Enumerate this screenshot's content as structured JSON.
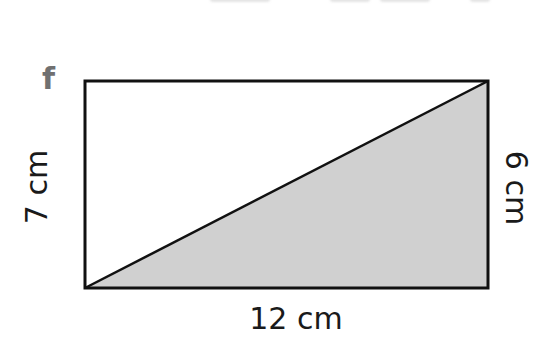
{
  "figure": {
    "part_label": "f",
    "shape": "rectangle",
    "shaded_region": "right triangle (bottom-left, top-right, bottom-right)",
    "dimensions": {
      "left": "7 cm",
      "right": "6 cm",
      "bottom": "12 cm"
    },
    "colors": {
      "outline": "#111111",
      "shade": "#d0d0d0",
      "part_label": "#707070"
    }
  }
}
